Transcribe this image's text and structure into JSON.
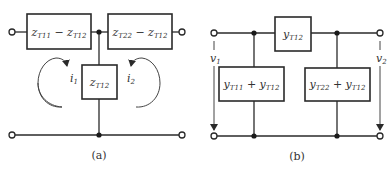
{
  "diagram": {
    "a": {
      "caption": "(a)",
      "series_left": {
        "var1": "z",
        "sub1": "T11",
        "op": " − ",
        "var2": "z",
        "sub2": "T12"
      },
      "series_right": {
        "var1": "z",
        "sub1": "T22",
        "op": " − ",
        "var2": "z",
        "sub2": "T12"
      },
      "shunt": {
        "var1": "z",
        "sub1": "T12"
      },
      "current_left": {
        "var": "i",
        "sub": "1"
      },
      "current_right": {
        "var": "i",
        "sub": "2"
      }
    },
    "b": {
      "caption": "(b)",
      "series": {
        "var1": "y",
        "sub1": "T12"
      },
      "shunt_left": {
        "var1": "y",
        "sub1": "T11",
        "op": " + ",
        "var2": "y",
        "sub2": "T12"
      },
      "shunt_right": {
        "var1": "y",
        "sub1": "T22",
        "op": " + ",
        "var2": "y",
        "sub2": "T12"
      },
      "voltage_left": {
        "var": "v",
        "sub": "1"
      },
      "voltage_right": {
        "var": "v",
        "sub": "2"
      }
    },
    "colors": {
      "line": "#2a2a2a",
      "background": "#ffffff"
    }
  }
}
